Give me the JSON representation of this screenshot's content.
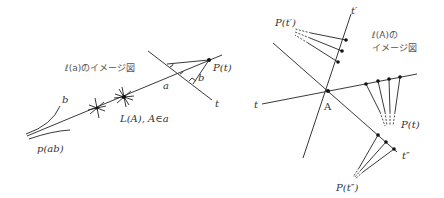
{
  "left_diagram": {
    "caption": "ℓ(a)のイメージ図",
    "labels": {
      "line_a": "a",
      "line_t": "t",
      "point_p": "P(t)",
      "perp_b": "b",
      "curve_b": "b",
      "curve_pab": "p(ab)",
      "star_label": "L(A), A∈a"
    }
  },
  "right_diagram": {
    "caption_line1": "ℓ(A)の",
    "caption_line2": "イメージ図",
    "labels": {
      "point_A": "A",
      "line_t": "t",
      "line_t_prime": "t′",
      "line_t_dprime": "t″",
      "p_t": "P(t)",
      "p_t_prime": "P(t′)",
      "p_t_dprime": "P(t″)"
    }
  }
}
